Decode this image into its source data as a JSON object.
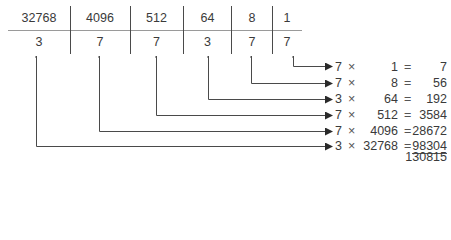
{
  "table": {
    "place_values": [
      "32768",
      "4096",
      "512",
      "64",
      "8",
      "1"
    ],
    "digits": [
      "3",
      "7",
      "7",
      "3",
      "7",
      "7"
    ]
  },
  "products": [
    {
      "digit": "7",
      "times": "×",
      "place_value": "1",
      "equals": "=",
      "result": "7"
    },
    {
      "digit": "7",
      "times": "×",
      "place_value": "8",
      "equals": "=",
      "result": "56"
    },
    {
      "digit": "3",
      "times": "×",
      "place_value": "64",
      "equals": "=",
      "result": "192"
    },
    {
      "digit": "7",
      "times": "×",
      "place_value": "512",
      "equals": "=",
      "result": "3584"
    },
    {
      "digit": "7",
      "times": "×",
      "place_value": "4096",
      "equals": "=",
      "result": "28672"
    },
    {
      "digit": "3",
      "times": "×",
      "place_value": "32768",
      "equals": "=",
      "result": "98304"
    }
  ],
  "total": "130815",
  "colors": {
    "line": "#4a4a4a",
    "text": "#3a3a3a"
  }
}
